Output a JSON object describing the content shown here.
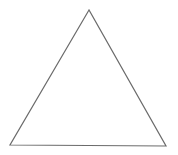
{
  "diagram": {
    "shape": "triangle",
    "vertices": [
      {
        "x": 89,
        "y": 10
      },
      {
        "x": 10,
        "y": 145
      },
      {
        "x": 166,
        "y": 146
      }
    ],
    "stroke": "#6b6b6b",
    "stroke_width": 1.2,
    "fill": "none",
    "background": "#ffffff"
  }
}
